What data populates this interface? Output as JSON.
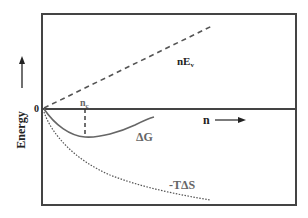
{
  "diagram": {
    "type": "energy-vs-n",
    "y_axis_label": "Energy",
    "x_axis_label": "n",
    "origin_label": "0",
    "critical_label": "n",
    "critical_subscript": "c",
    "curves": [
      {
        "name": "nE",
        "subscript": "v",
        "style": "dashed",
        "description": "linear increasing"
      },
      {
        "name": "ΔG",
        "style": "solid",
        "description": "dips to minimum at n_c then rises"
      },
      {
        "name": "-TΔS",
        "style": "dotted",
        "description": "decreasing"
      }
    ],
    "colors": {
      "frame": "#444444",
      "curve_solid": "#666666",
      "curve_dashed": "#555555",
      "curve_dotted": "#555555",
      "text_dark": "#222222",
      "text_gray": "#666666"
    }
  }
}
